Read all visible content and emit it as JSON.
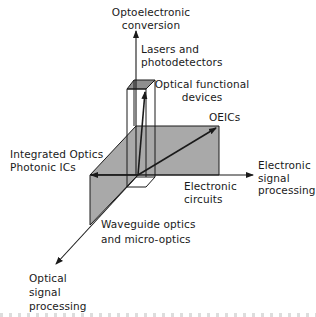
{
  "diagram": {
    "type": "3d-axes-concept",
    "colors": {
      "line": "#1a1a1a",
      "plane_fill": "#a9a9a9",
      "box_top_fill": "#8f8f8f",
      "background": "#ffffff"
    },
    "axes": {
      "vertical": {
        "line1": "Optoelectronic",
        "line2": "conversion"
      },
      "horizontal": {
        "line1": "Electronic",
        "line2": "signal",
        "line3": "processing"
      },
      "diagonal": {
        "line1": "Optical",
        "line2": "signal",
        "line3": "processing"
      }
    },
    "labels": {
      "lasers": {
        "line1": "Lasers and",
        "line2": "photodetectors"
      },
      "optical_functional": {
        "line1": "Optical functional",
        "line2": "devices"
      },
      "oeics": "OEICs",
      "integrated_optics": {
        "line1": "Integrated Optics",
        "line2": "Photonic ICs"
      },
      "electronic_circuits": {
        "line1": "Electronic",
        "line2": "circuits"
      },
      "waveguide": {
        "line1": "Waveguide optics",
        "line2": "and micro-optics"
      }
    }
  }
}
